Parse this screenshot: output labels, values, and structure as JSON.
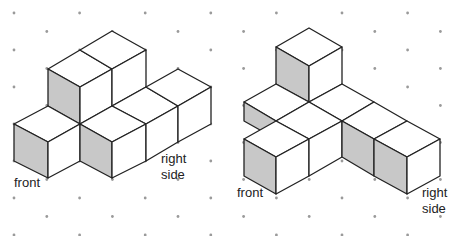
{
  "colors": {
    "line": "#222222",
    "shade": "#c8c8c8",
    "face": "#ffffff",
    "dot": "#9a9a9a"
  },
  "figures": [
    {
      "name": "figure-left",
      "labels": {
        "front": "front",
        "right": "right\nside",
        "right_line1": "right",
        "right_line2": "side"
      }
    },
    {
      "name": "figure-right",
      "labels": {
        "front": "front",
        "right_line1": "right",
        "right_line2": "side"
      }
    }
  ]
}
